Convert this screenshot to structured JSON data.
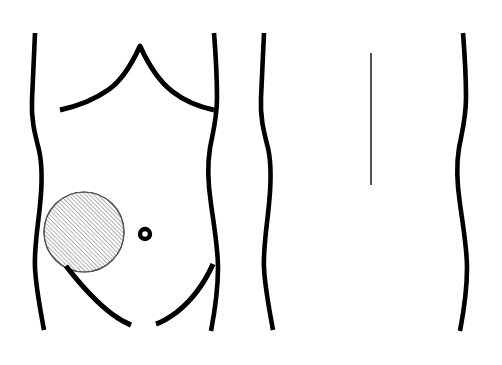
{
  "figure": {
    "background_color": "#ffffff",
    "stroke_color": "#000000",
    "hatch_color": "#666666",
    "width": 502,
    "height": 365
  },
  "panels": [
    {
      "id": "anterior-view",
      "label": "Anterior abdominal view",
      "features": [
        "left-flank-contour",
        "right-flank-contour",
        "costal-margin",
        "hatched-lesion",
        "umbilicus",
        "left-inguinal-line",
        "right-inguinal-line"
      ]
    },
    {
      "id": "lateral-view",
      "label": "Lateral torso view with midline marker",
      "features": [
        "left-torso-contour",
        "right-torso-contour",
        "midline-incision-marker"
      ]
    }
  ],
  "markers": {
    "lesion": {
      "name": "hatched-lesion",
      "shape": "circle",
      "center_x": 84,
      "center_y": 232,
      "radius": 40,
      "fill_pattern": "diagonal-hatch",
      "hatch_angle_deg": 45,
      "hatch_spacing_px": 3,
      "outline_color": "#555555"
    },
    "umbilicus": {
      "name": "umbilicus",
      "shape": "ring",
      "center_x": 145,
      "center_y": 234,
      "outer_radius": 7,
      "wall_thickness": 4.4
    },
    "midline_incision": {
      "name": "midline-incision-marker",
      "shape": "vertical-line",
      "x": 371,
      "y_start": 53,
      "y_end": 185,
      "stroke_width": 1.5
    }
  },
  "paths": {
    "left_flank": "M 35,33 C 34,60 33,80 32,100 C 31,120 35,134 39,150 C 43,168 42,186 40,205 C 38,226 34,248 35,268 C 36,288 40,308 44,330",
    "right_flank": "M 214,33 C 216,58 217,78 217,98 C 217,118 213,132 210,148 C 207,166 208,184 211,204 C 214,226 218,248 218,268 C 218,288 215,310 211,331",
    "costal_margin": "M 60,110 C 78,106 94,100 108,90 C 120,82 130,68 140,46 C 150,68 161,83 173,92 C 186,102 200,107 214,110",
    "left_inguinal": "M 66,266 C 80,284 96,302 112,314 C 120,320 126,323 131,325",
    "right_inguinal": "M 213,264 C 205,282 192,300 177,312 C 169,318 162,322 156,324",
    "lateral_left": "M 264,33 C 263,58 262,78 261,98 C 260,118 264,132 268,148 C 272,166 271,184 269,204 C 267,226 263,248 264,268 C 265,288 269,308 273,330",
    "lateral_right": "M 463,33 C 465,58 466,78 466,98 C 466,118 462,132 459,148 C 456,166 457,184 460,204 C 463,226 467,248 467,268 C 467,288 464,310 460,331"
  }
}
